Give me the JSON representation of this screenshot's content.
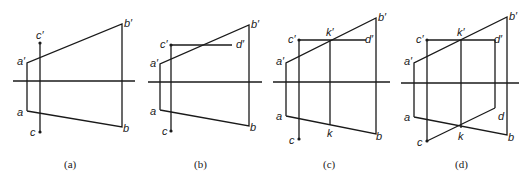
{
  "figures": [
    {
      "id": "a",
      "caption": "(a)",
      "labels": {
        "a_prime": "a′",
        "b_prime": "b′",
        "a": "a",
        "b": "b",
        "c_prime": "c′",
        "c": "c"
      }
    },
    {
      "id": "b",
      "caption": "(b)",
      "labels": {
        "a_prime": "a′",
        "b_prime": "b′",
        "a": "a",
        "b": "b",
        "c_prime": "c′",
        "d_prime": "d′",
        "c": "c"
      }
    },
    {
      "id": "c",
      "caption": "(c)",
      "labels": {
        "a_prime": "a′",
        "b_prime": "b′",
        "a": "a",
        "b": "b",
        "c_prime": "c′",
        "k_prime": "k′",
        "d_prime": "d′",
        "c": "c",
        "k": "k"
      }
    },
    {
      "id": "d",
      "caption": "(d)",
      "labels": {
        "a_prime": "a′",
        "b_prime": "b′",
        "a": "a",
        "b": "b",
        "c_prime": "c′",
        "k_prime": "k′",
        "d_prime": "d′",
        "c": "c",
        "k": "k",
        "d": "d"
      }
    }
  ]
}
